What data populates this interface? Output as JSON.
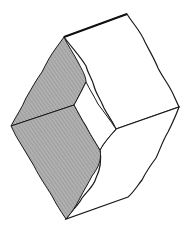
{
  "figure": {
    "title": "",
    "colors": {
      "background": "#ffffff",
      "outline": "#1a1a1a",
      "shaded_face": "#a9a9a9",
      "hatch": "#7a7a7a",
      "light_face": "#ffffff"
    }
  }
}
